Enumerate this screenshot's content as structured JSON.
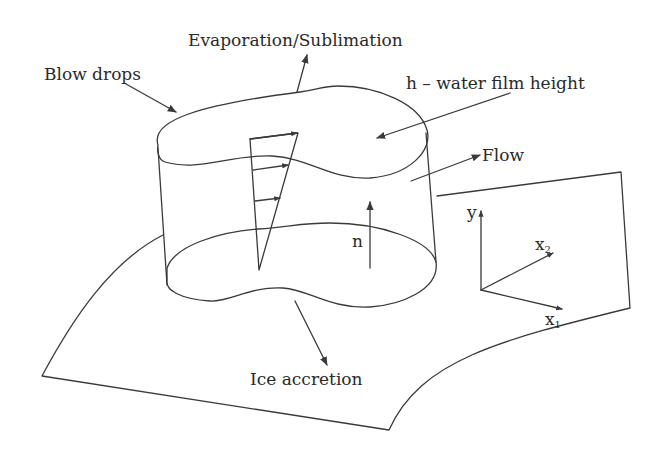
{
  "diagram": {
    "labels": {
      "evaporation": "Evaporation/Sublimation",
      "blow_drops": "Blow drops",
      "film_height": "h – water film height",
      "flow": "Flow",
      "normal": "n",
      "ice_accretion": "Ice accretion"
    },
    "axes": {
      "y": "y",
      "x1_base": "x",
      "x1_sub": "1",
      "x2_base": "x",
      "x2_sub": "2"
    },
    "colors": {
      "line": "#3a3a3a",
      "text": "#2a2a2a",
      "background": "#ffffff"
    }
  }
}
